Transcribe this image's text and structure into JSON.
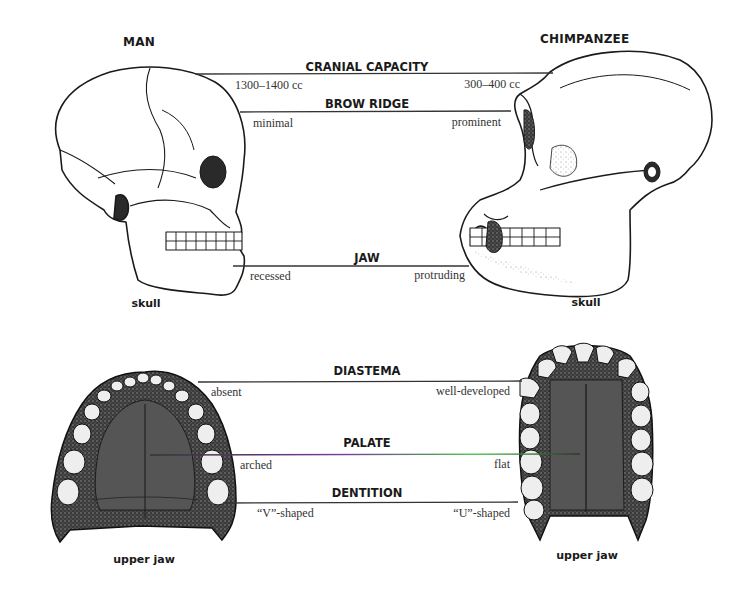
{
  "figure": {
    "subjects": {
      "left": {
        "title": "MAN",
        "skull_caption": "skull",
        "jaw_caption": "upper jaw"
      },
      "right": {
        "title": "CHIMPANZEE",
        "skull_caption": "skull",
        "jaw_caption": "upper jaw"
      }
    },
    "skull_features": [
      {
        "feature": "CRANIAL CAPACITY",
        "man": "1300–1400 cc",
        "chimpanzee": "300–400 cc"
      },
      {
        "feature": "BROW RIDGE",
        "man": "minimal",
        "chimpanzee": "prominent"
      },
      {
        "feature": "JAW",
        "man": "recessed",
        "chimpanzee": "protruding"
      }
    ],
    "jaw_features": [
      {
        "feature": "DIASTEMA",
        "man": "absent",
        "chimpanzee": "well-developed"
      },
      {
        "feature": "PALATE",
        "man": "arched",
        "chimpanzee": "flat"
      },
      {
        "feature": "DENTITION",
        "man": "“V”-shaped",
        "chimpanzee": "“U”-shaped"
      }
    ],
    "colors": {
      "ink": "#1a1a1a",
      "leader_line": "#333333",
      "palate_line_accent": "#3fbf3f",
      "background": "#ffffff"
    }
  }
}
